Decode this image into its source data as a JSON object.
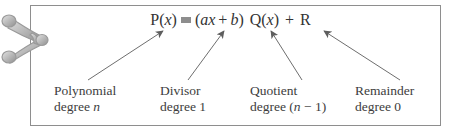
{
  "figure": {
    "equation": {
      "lhs_fn": "P",
      "lhs_open": "(",
      "lhs_var": "x",
      "lhs_close": ")",
      "relation_symbol": "=",
      "divisor_open": "(",
      "divisor_coeff": "a",
      "divisor_var": "x",
      "divisor_plus": "+",
      "divisor_const": "b",
      "divisor_close": ")",
      "quotient_fn": "Q",
      "quotient_open": "(",
      "quotient_var": "x",
      "quotient_close": ")",
      "plus": "+",
      "remainder": "R",
      "full_text": "P(x) = (ax + b) Q(x) + R"
    },
    "labels": [
      {
        "id": "polynomial",
        "line1": "Polynomial",
        "line2_prefix": "degree ",
        "line2_italic": "n",
        "line2_suffix": "",
        "target": "P(x)"
      },
      {
        "id": "divisor",
        "line1": "Divisor",
        "line2_prefix": "degree 1",
        "line2_italic": "",
        "line2_suffix": "",
        "target": "(ax + b)"
      },
      {
        "id": "quotient",
        "line1": "Quotient",
        "line2_prefix": "degree (",
        "line2_italic": "n",
        "line2_suffix": " − 1)",
        "target": "Q(x)"
      },
      {
        "id": "remainder",
        "line1": "Remainder",
        "line2_prefix": "degree 0",
        "line2_italic": "",
        "line2_suffix": "",
        "target": "R"
      }
    ],
    "colors": {
      "border": "#8e8e8e",
      "text": "#3d3d3d",
      "arrow": "#6e6e6e",
      "ornament": "#b9b9b9",
      "background": "#ffffff"
    }
  }
}
